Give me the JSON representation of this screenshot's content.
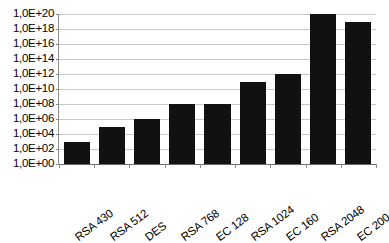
{
  "chart_data": {
    "type": "bar",
    "title": "",
    "subtitle": "",
    "xlabel": "",
    "ylabel": "",
    "categories": [
      "RSA 430",
      "RSA 512",
      "DES",
      "RSA 768",
      "EC 128",
      "RSA 1024",
      "EC 160",
      "RSA 2048",
      "EC 200"
    ],
    "values": [
      1000.0,
      100000.0,
      1000000.0,
      100000000.0,
      100000000.0,
      100000000000.0,
      1000000000000.0,
      1e+20,
      1e+19
    ],
    "value_exponents": [
      3,
      5,
      6,
      8,
      8,
      11,
      12,
      20,
      19
    ],
    "series": [
      {
        "name": "",
        "values": [
          1000.0,
          100000.0,
          1000000.0,
          100000000.0,
          100000000.0,
          100000000000.0,
          1000000000000.0,
          1e+20,
          1e+19
        ]
      }
    ],
    "yscale": "log",
    "ylim": [
      1,
      1e+20
    ],
    "ytick_values": [
      1,
      100,
      10000,
      1000000,
      100000000,
      10000000000,
      1000000000000,
      100000000000000,
      10000000000000000,
      1000000000000000000,
      100000000000000000000
    ],
    "ytick_labels": [
      "1,0E+20",
      "1,0E+18",
      "1,0E+16",
      "1,0E+14",
      "1,0E+12",
      "1,0E+10",
      "1,0E+08",
      "1,0E+06",
      "1,0E+04",
      "1,0E+02",
      "1,0E+00"
    ],
    "grid": true,
    "grid_axis": "y",
    "legend": false,
    "legend_position": "none",
    "bar_color": "#111111",
    "gridline_color": "#c9c9c9",
    "axis_color": "#8c8c8c",
    "background_color": "#ffffff",
    "xtick_rotation": -37
  }
}
